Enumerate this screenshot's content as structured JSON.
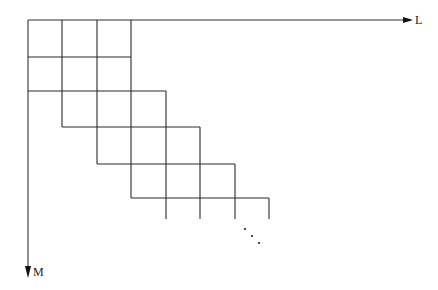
{
  "diagram": {
    "axes": {
      "horizontal": {
        "label": "L",
        "direction": "right"
      },
      "vertical": {
        "label": "M",
        "direction": "down"
      }
    },
    "colors": {
      "line": "#2a2a2a",
      "arrow": "#111111",
      "text": "#222222"
    },
    "band": {
      "rows": [
        {
          "row": 0,
          "cols": [
            0,
            1,
            2
          ]
        },
        {
          "row": 1,
          "cols": [
            0,
            1,
            2
          ]
        },
        {
          "row": 2,
          "cols": [
            1,
            2,
            3
          ]
        },
        {
          "row": 3,
          "cols": [
            2,
            3,
            4
          ]
        },
        {
          "row": 4,
          "cols": [
            3,
            4,
            5
          ]
        },
        {
          "row": 5,
          "cols": [
            4,
            5,
            6
          ]
        }
      ],
      "continuation": "diagonal-ellipsis",
      "ellipsis_text": "⋱"
    }
  }
}
